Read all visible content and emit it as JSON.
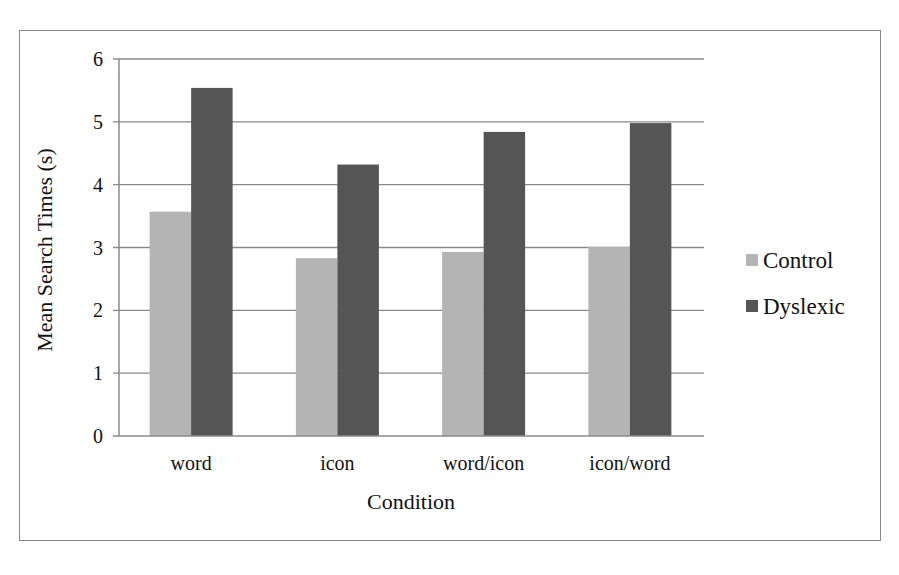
{
  "chart_data": {
    "type": "bar",
    "title": "",
    "xlabel": "Condition",
    "ylabel": "Mean Search Times (s)",
    "categories": [
      "word",
      "icon",
      "word/icon",
      "icon/word"
    ],
    "series": [
      {
        "name": "Control",
        "color": "#b4b4b4",
        "values": [
          3.57,
          2.83,
          2.93,
          3.01
        ]
      },
      {
        "name": "Dyslexic",
        "color": "#555555",
        "values": [
          5.54,
          4.32,
          4.84,
          4.98
        ]
      }
    ],
    "ylim": [
      0,
      6
    ],
    "yticks": [
      "0",
      "1",
      "2",
      "3",
      "4",
      "5",
      "6"
    ],
    "grid": true,
    "legend_position": "right"
  },
  "legend": {
    "items": [
      {
        "label": "Control",
        "color": "#b4b4b4"
      },
      {
        "label": "Dyslexic",
        "color": "#555555"
      }
    ]
  }
}
